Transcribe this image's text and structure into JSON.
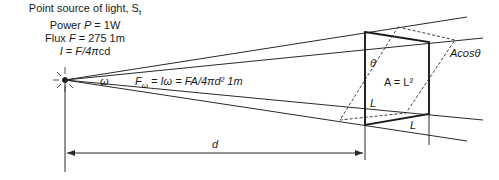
{
  "source_info": {
    "title": "Point source of light, S",
    "title_subscript": "t",
    "power_prefix": "Power ",
    "power_symbol": "P",
    "power_value": " = 1W",
    "flux_prefix": "Flux ",
    "flux_symbol": "F",
    "flux_value": " = 275 1m",
    "intensity_symbol": "I",
    "intensity_eq": " = ",
    "intensity_formula": "F/4π",
    "intensity_unit": "cd"
  },
  "labels": {
    "omega": "ω",
    "flux_omega_symbol": "F",
    "flux_omega_sub": "ω",
    "flux_omega_formula": " = Iω = FA/4πd² 1m",
    "theta": "θ",
    "area": "A = L²",
    "side_L_vertical": "L",
    "side_L_bottom": "L",
    "projected_area": "Acosθ",
    "distance": "d"
  },
  "colors": {
    "line": "#2a2a2a",
    "background": "#ffffff"
  }
}
